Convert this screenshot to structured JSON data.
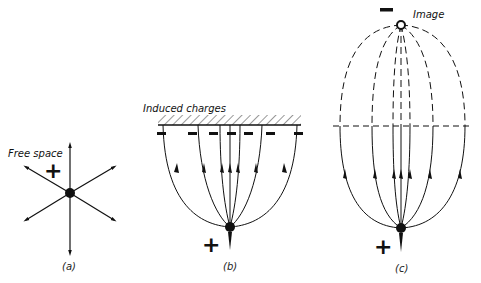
{
  "figure": {
    "panels": [
      {
        "id": "a",
        "caption": "(a)",
        "label": "Free space",
        "charge_sign": "+",
        "description": "Isolated positive charge with radial field lines"
      },
      {
        "id": "b",
        "caption": "(b)",
        "label": "Induced charges",
        "charge_sign": "+",
        "induced_sign": "−",
        "description": "Positive charge near conducting plane; field lines terminate on induced negative charges"
      },
      {
        "id": "c",
        "caption": "(c)",
        "label": "Image",
        "charge_sign": "+",
        "image_sign": "−",
        "description": "Equivalent image charge representation; dashed line marks conductor plane"
      }
    ]
  },
  "colors": {
    "ink": "#111111",
    "background": "#ffffff"
  }
}
